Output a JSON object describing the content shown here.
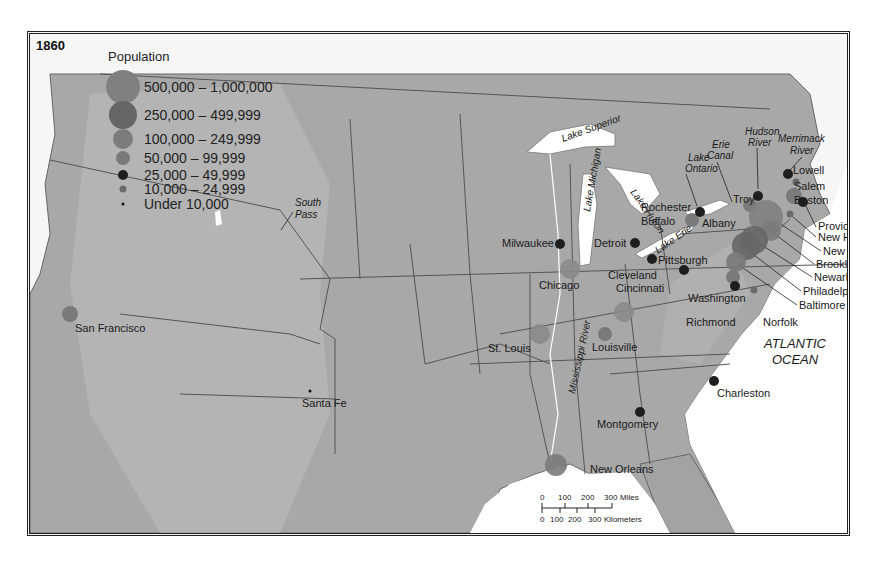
{
  "map": {
    "year": "1860",
    "ocean_label": [
      "ATLANTIC",
      "OCEAN"
    ],
    "colors": {
      "land": "#a9a9a9",
      "land_dark": "#8f8f8f",
      "water": "#ffffff",
      "border": "#555555",
      "circle_large": "#8a8a8a",
      "circle_dark": "#6e6e6e",
      "circle_black": "#1e1e1e"
    }
  },
  "legend": {
    "title": "Population",
    "items": [
      {
        "label": "500,000 – 1,000,000",
        "r": 17,
        "color": "#808080"
      },
      {
        "label": "250,000 – 499,999",
        "r": 14,
        "color": "#666666"
      },
      {
        "label": "100,000 – 249,999",
        "r": 10,
        "color": "#7c7c7c"
      },
      {
        "label": "50,000 – 99,999",
        "r": 7,
        "color": "#7a7a7a"
      },
      {
        "label": "25,000 – 49,999",
        "r": 5,
        "color": "#1e1e1e"
      },
      {
        "label": "10,000 – 24,999",
        "r": 3.5,
        "color": "#6a6a6a"
      },
      {
        "label": "Under 10,000",
        "r": 1.5,
        "color": "#111111"
      }
    ]
  },
  "cities": [
    {
      "name": "San Francisco",
      "x": 40,
      "y": 280,
      "r": 8,
      "color": "#7a7a7a",
      "lx": 45,
      "ly": 298
    },
    {
      "name": "Santa Fe",
      "x": 280,
      "y": 357,
      "r": 1.5,
      "color": "#111111",
      "lx": 272,
      "ly": 373
    },
    {
      "name": "St. Louis",
      "x": 510,
      "y": 300,
      "r": 10,
      "color": "#8a8a8a",
      "lx": 458,
      "ly": 318
    },
    {
      "name": "Louisville",
      "x": 575,
      "y": 300,
      "r": 7,
      "color": "#7a7a7a",
      "lx": 562,
      "ly": 317
    },
    {
      "name": "Cincinnati",
      "x": 594,
      "y": 278,
      "r": 10,
      "color": "#8a8a8a",
      "lx": 586,
      "ly": 258
    },
    {
      "name": "Chicago",
      "x": 540,
      "y": 235,
      "r": 10,
      "color": "#8a8a8a",
      "lx": 509,
      "ly": 255
    },
    {
      "name": "Milwaukee",
      "x": 530,
      "y": 210,
      "r": 5,
      "color": "#1e1e1e",
      "lx": 472,
      "ly": 213
    },
    {
      "name": "Detroit",
      "x": 605,
      "y": 209,
      "r": 5,
      "color": "#1e1e1e",
      "lx": 564,
      "ly": 213
    },
    {
      "name": "Cleveland",
      "x": 622,
      "y": 225,
      "r": 5,
      "color": "#1e1e1e",
      "lx": 578,
      "ly": 245
    },
    {
      "name": "Pittsburgh",
      "x": 654,
      "y": 236,
      "r": 5,
      "color": "#1e1e1e",
      "lx": 628,
      "ly": 230
    },
    {
      "name": "Buffalo",
      "x": 662,
      "y": 186,
      "r": 7,
      "color": "#7a7a7a",
      "lx": 611,
      "ly": 191
    },
    {
      "name": "Rochester",
      "x": 670,
      "y": 178,
      "r": 5,
      "color": "#1e1e1e",
      "lx": 611,
      "ly": 177
    },
    {
      "name": "Albany",
      "x": 720,
      "y": 171,
      "r": 7,
      "color": "#7a7a7a",
      "lx": 672,
      "ly": 193
    },
    {
      "name": "Troy",
      "x": 728,
      "y": 162,
      "r": 5,
      "color": "#1e1e1e",
      "lx": 703,
      "ly": 169
    },
    {
      "name": "Lowell",
      "x": 758,
      "y": 140,
      "r": 5,
      "color": "#1e1e1e",
      "lx": 763,
      "ly": 140
    },
    {
      "name": "Salem",
      "x": 766,
      "y": 148,
      "r": 3.5,
      "color": "#6a6a6a",
      "lx": 764,
      "ly": 156
    },
    {
      "name": "Boston",
      "x": 764,
      "y": 162,
      "r": 8,
      "color": "#7a7a7a",
      "lx": 764,
      "ly": 170
    },
    {
      "name": "Providence",
      "x": 773,
      "y": 168,
      "r": 5,
      "color": "#1e1e1e",
      "lx": 788,
      "ly": 196
    },
    {
      "name": "New Haven",
      "x": 760,
      "y": 180,
      "r": 3.5,
      "color": "#6a6a6a",
      "lx": 788,
      "ly": 207
    },
    {
      "name": "New York",
      "x": 736,
      "y": 183,
      "r": 17,
      "color": "#808080",
      "lx": 793,
      "ly": 221
    },
    {
      "name": "Brooklyn",
      "x": 741,
      "y": 197,
      "r": 10,
      "color": "#7a7a7a",
      "lx": 786,
      "ly": 234
    },
    {
      "name": "Newark",
      "x": 724,
      "y": 206,
      "r": 14,
      "color": "#666666",
      "lx": 784,
      "ly": 247
    },
    {
      "name": "Philadelphia",
      "x": 716,
      "y": 212,
      "r": 14,
      "color": "#666666",
      "lx": 773,
      "ly": 261
    },
    {
      "name": "Baltimore",
      "x": 706,
      "y": 228,
      "r": 10,
      "color": "#7a7a7a",
      "lx": 769,
      "ly": 275
    },
    {
      "name": "Washington",
      "x": 703,
      "y": 243,
      "r": 7,
      "color": "#7a7a7a",
      "lx": 658,
      "ly": 268
    },
    {
      "name": "Richmond",
      "x": 705,
      "y": 252,
      "r": 5,
      "color": "#1e1e1e",
      "lx": 656,
      "ly": 292
    },
    {
      "name": "Norfolk",
      "x": 724,
      "y": 256,
      "r": 3.5,
      "color": "#6a6a6a",
      "lx": 733,
      "ly": 292
    },
    {
      "name": "Charleston",
      "x": 684,
      "y": 347,
      "r": 5,
      "color": "#1e1e1e",
      "lx": 687,
      "ly": 363
    },
    {
      "name": "Montgomery",
      "x": 610,
      "y": 378,
      "r": 5,
      "color": "#1e1e1e",
      "lx": 567,
      "ly": 394
    },
    {
      "name": "New Orleans",
      "x": 526,
      "y": 431,
      "r": 11,
      "color": "#7a7a7a",
      "lx": 560,
      "ly": 439
    }
  ],
  "features": [
    {
      "name": "Lake Superior",
      "x": 533,
      "y": 108,
      "rotate": -20,
      "style": "italic"
    },
    {
      "name": "Lake Michigan",
      "x": 560,
      "y": 178,
      "rotate": -80,
      "style": "italic"
    },
    {
      "name": "Lake Huron",
      "x": 600,
      "y": 158,
      "rotate": 55,
      "style": "italic"
    },
    {
      "name": "Lake Erie",
      "x": 628,
      "y": 220,
      "rotate": -35,
      "style": "italic"
    },
    {
      "name": "Lake",
      "x": 658,
      "y": 127,
      "rotate": 0,
      "style": "italic"
    },
    {
      "name": "Ontario",
      "x": 655,
      "y": 138,
      "rotate": 0,
      "style": "italic"
    },
    {
      "name": "Erie",
      "x": 682,
      "y": 114,
      "rotate": 0,
      "style": "italic"
    },
    {
      "name": "Canal",
      "x": 677,
      "y": 125,
      "rotate": 0,
      "style": "italic"
    },
    {
      "name": "Hudson",
      "x": 715,
      "y": 101,
      "rotate": 0,
      "style": "italic"
    },
    {
      "name": "River",
      "x": 718,
      "y": 112,
      "rotate": 0,
      "style": "italic"
    },
    {
      "name": "Merrimack",
      "x": 748,
      "y": 108,
      "rotate": 0,
      "style": "italic"
    },
    {
      "name": "River",
      "x": 760,
      "y": 120,
      "rotate": 0,
      "style": "italic"
    },
    {
      "name": "South",
      "x": 265,
      "y": 172,
      "rotate": 0,
      "style": "italic"
    },
    {
      "name": "Pass",
      "x": 265,
      "y": 184,
      "rotate": 0,
      "style": "italic"
    },
    {
      "name": "Mississippi River",
      "x": 545,
      "y": 360,
      "rotate": -78,
      "style": "italic"
    }
  ],
  "scale_bar": {
    "miles_label": "Miles",
    "km_label": "Kilometers",
    "miles_ticks": [
      "0",
      "100",
      "200",
      "300"
    ],
    "km_ticks": [
      "0",
      "100",
      "200",
      "300"
    ]
  }
}
